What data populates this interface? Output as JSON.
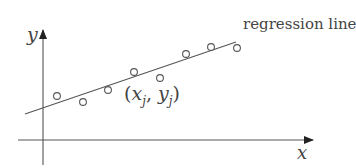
{
  "diagram": {
    "type": "regression-line-illustration",
    "axes": {
      "x_label": "x",
      "y_label": "y",
      "origin": [
        43,
        140
      ],
      "x_axis": {
        "from": [
          18,
          140
        ],
        "to": [
          313,
          140
        ]
      },
      "y_axis": {
        "from": [
          43,
          165
        ],
        "to": [
          43,
          30
        ]
      }
    },
    "regression_line": {
      "label": "regression line",
      "from": [
        25,
        114
      ],
      "to": [
        236,
        42
      ]
    },
    "points": [
      {
        "cx": 57,
        "cy": 96
      },
      {
        "cx": 83,
        "cy": 102
      },
      {
        "cx": 108,
        "cy": 90
      },
      {
        "cx": 134,
        "cy": 72
      },
      {
        "cx": 160,
        "cy": 78
      },
      {
        "cx": 186,
        "cy": 54
      },
      {
        "cx": 211,
        "cy": 47
      },
      {
        "cx": 237,
        "cy": 48
      }
    ],
    "point_annotation": {
      "open": "(",
      "x": "x",
      "x_sub": "j",
      "sep": ", ",
      "y": "y",
      "y_sub": "j",
      "close": ")"
    },
    "colors": {
      "stroke": "#444444",
      "background": "#ffffff"
    }
  }
}
